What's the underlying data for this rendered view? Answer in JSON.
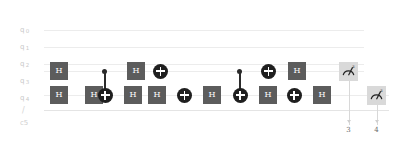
{
  "diagram": {
    "kind": "quantum-circuit",
    "width": 403,
    "height": 144
  },
  "colors": {
    "background": "#ffffff",
    "wire": "#ececec",
    "gate_box_fill": "#5c5c5c",
    "gate_box_text": "#ffffff",
    "control_dot": "#2b2b2b",
    "target_fill": "#1f1f1f",
    "measure_fill": "#d9d9d9",
    "label_text": "#c9c9c9",
    "cbit_text": "#6b6b6b"
  },
  "registers": {
    "qubits": [
      {
        "name": "q",
        "index": "0",
        "label": "q",
        "sub": "0",
        "y": 30
      },
      {
        "name": "q",
        "index": "1",
        "label": "q",
        "sub": "1",
        "y": 47
      },
      {
        "name": "q",
        "index": "2",
        "label": "q",
        "sub": "2",
        "y": 53
      },
      {
        "name": "q",
        "index": "3",
        "label": "q",
        "sub": "3",
        "y": 71
      },
      {
        "name": "q",
        "index": "4",
        "label": "q",
        "sub": "4",
        "y": 95
      }
    ],
    "classical": {
      "label": "c5",
      "slash": "/",
      "width_label": "5"
    }
  },
  "gates": {
    "q3_row": [
      {
        "type": "H",
        "label": "H"
      },
      {
        "type": "control",
        "label": ""
      },
      {
        "type": "H",
        "label": "H"
      },
      {
        "type": "X",
        "label": ""
      },
      {
        "type": "control",
        "label": ""
      },
      {
        "type": "X",
        "label": ""
      },
      {
        "type": "H",
        "label": "H"
      },
      {
        "type": "measure",
        "label": "z"
      }
    ],
    "q4_row": [
      {
        "type": "H",
        "label": "H"
      },
      {
        "type": "H",
        "label": "H"
      },
      {
        "type": "X",
        "label": ""
      },
      {
        "type": "H",
        "label": "H"
      },
      {
        "type": "H",
        "label": "H"
      },
      {
        "type": "X",
        "label": ""
      },
      {
        "type": "H",
        "label": "H"
      },
      {
        "type": "X",
        "label": ""
      },
      {
        "type": "H",
        "label": "H"
      },
      {
        "type": "X",
        "label": ""
      },
      {
        "type": "H",
        "label": "H"
      },
      {
        "type": "measure",
        "label": "z"
      }
    ]
  },
  "labels": {
    "hadamard": "H",
    "measure_basis": "z"
  },
  "classical_bits": [
    {
      "name": "cbit-3",
      "value": "3"
    },
    {
      "name": "cbit-4",
      "value": "4"
    }
  ]
}
